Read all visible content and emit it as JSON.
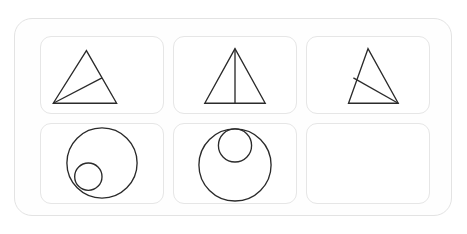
{
  "panel": {
    "name": "shape-matrix-panel",
    "rows": 2,
    "columns": 3,
    "background_color": "#fefefe",
    "border_color": "#e3e3e3",
    "cell_border_color": "#e6e6e6",
    "stroke_color": "#2b2b2b"
  },
  "cells": [
    {
      "index": 1,
      "position": "row-1-col-1",
      "figure": "triangle-with-cevian-from-bottom-left",
      "state": "filled",
      "label": "",
      "shapes": [
        {
          "kind": "polygon",
          "name": "outer-triangle",
          "points": "46,14 12,68 77,68"
        },
        {
          "kind": "line",
          "name": "cevian-line",
          "x1": 12,
          "y1": 68,
          "x2": 62,
          "y2": 42
        }
      ]
    },
    {
      "index": 2,
      "position": "row-1-col-2",
      "figure": "triangle-with-vertical-median",
      "state": "filled",
      "label": "",
      "shapes": [
        {
          "kind": "polygon",
          "name": "outer-triangle",
          "points": "62,12 31,68 93,68"
        },
        {
          "kind": "line",
          "name": "median-line",
          "x1": 62,
          "y1": 12,
          "x2": 62,
          "y2": 68
        }
      ]
    },
    {
      "index": 3,
      "position": "row-1-col-3",
      "figure": "triangle-with-cevian-from-bottom-right",
      "state": "filled",
      "label": "",
      "shapes": [
        {
          "kind": "polygon",
          "name": "outer-triangle",
          "points": "62,12 42,68 93,68"
        },
        {
          "kind": "line",
          "name": "cevian-line",
          "x1": 93,
          "y1": 68,
          "x2": 47,
          "y2": 42
        }
      ]
    },
    {
      "index": 4,
      "position": "row-2-col-1",
      "figure": "large-circle-with-small-circle-lower-left",
      "state": "filled",
      "label": "",
      "shapes": [
        {
          "kind": "circle",
          "name": "outer-circle",
          "cx": 62,
          "cy": 40,
          "r": 36
        },
        {
          "kind": "circle",
          "name": "inner-circle",
          "cx": 48,
          "cy": 54,
          "r": 14
        }
      ]
    },
    {
      "index": 5,
      "position": "row-2-col-2",
      "figure": "large-circle-with-small-circle-top-center",
      "state": "filled",
      "label": "",
      "shapes": [
        {
          "kind": "circle",
          "name": "outer-circle",
          "cx": 62,
          "cy": 42,
          "r": 37
        },
        {
          "kind": "circle",
          "name": "inner-circle",
          "cx": 62,
          "cy": 22,
          "r": 17
        }
      ]
    },
    {
      "index": 6,
      "position": "row-2-col-3",
      "figure": "blank-answer-slot",
      "state": "empty",
      "label": "",
      "shapes": []
    }
  ]
}
